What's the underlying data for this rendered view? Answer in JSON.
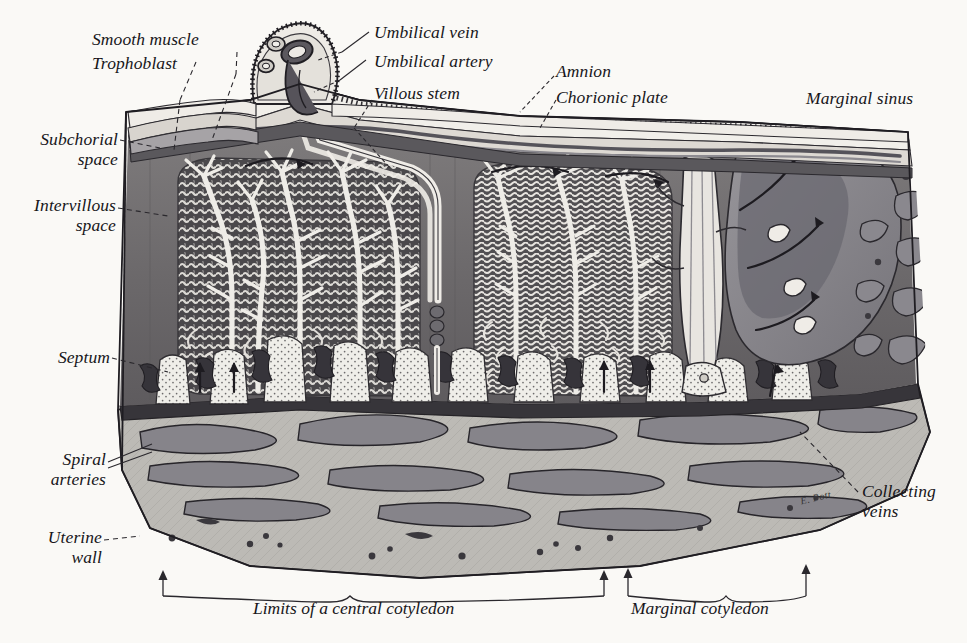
{
  "figure": {
    "type": "anatomical-illustration",
    "signature": "E. Pott",
    "background_color": "#faf9f6",
    "ink_color": "#17161a"
  },
  "labels": [
    {
      "id": "smooth-muscle",
      "text": "Smooth muscle",
      "x": 92,
      "y": 30,
      "align": "left"
    },
    {
      "id": "trophoblast",
      "text": "Trophoblast",
      "x": 92,
      "y": 54,
      "align": "left"
    },
    {
      "id": "umbilical-vein",
      "text": "Umbilical vein",
      "x": 374,
      "y": 23,
      "align": "left"
    },
    {
      "id": "umbilical-artery",
      "text": "Umbilical artery",
      "x": 374,
      "y": 52,
      "align": "left"
    },
    {
      "id": "villous-stem",
      "text": "Villous stem",
      "x": 374,
      "y": 85,
      "align": "left"
    },
    {
      "id": "amnion",
      "text": "Amnion",
      "x": 556,
      "y": 66,
      "align": "left"
    },
    {
      "id": "chorionic-plate",
      "text": "Chorionic plate",
      "x": 556,
      "y": 90,
      "align": "left"
    },
    {
      "id": "marginal-sinus",
      "text": "Marginal sinus",
      "x": 806,
      "y": 91,
      "align": "left"
    },
    {
      "id": "subchorial-space",
      "text": "Subchorial\nspace",
      "x": 12,
      "y": 130,
      "align": "left"
    },
    {
      "id": "intervillous-space",
      "text": "Intervillous\nspace",
      "x": 8,
      "y": 195,
      "align": "left"
    },
    {
      "id": "septum",
      "text": "Septum",
      "x": 44,
      "y": 350,
      "align": "left"
    },
    {
      "id": "spiral-arteries",
      "text": "Spiral\narteries",
      "x": 42,
      "y": 449,
      "align": "left"
    },
    {
      "id": "uterine-wall",
      "text": "Uterine\nwall",
      "x": 34,
      "y": 527,
      "align": "left"
    },
    {
      "id": "collecting-veins",
      "text": "Collecting\nveins",
      "x": 862,
      "y": 483,
      "align": "left"
    }
  ],
  "captions": [
    {
      "id": "central-cotyledon",
      "text": "Limits of a central cotyledon",
      "x": 253,
      "y": 607
    },
    {
      "id": "marginal-cotyledon",
      "text": "Marginal cotyledon",
      "x": 631,
      "y": 607
    }
  ],
  "palette": {
    "intervillous_dark": "#6f6c6d",
    "intervillous_darker": "#58565a",
    "villus_mass": "#4a484b",
    "vessel_white": "#f2f0ec",
    "uterine_wall": "#b9b7b2",
    "uterine_vessel": "#8b898a",
    "membrane_light": "#e9e7e2",
    "chorion_mid": "#cfccc6",
    "marginal_sinus": "#8b8a8c",
    "stipple": "#efeee9"
  }
}
